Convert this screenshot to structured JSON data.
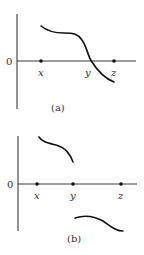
{
  "figures": [
    {
      "id": "a",
      "caption": "(a)",
      "origin_label": "0",
      "points": [
        {
          "label": "x",
          "px": 41
        },
        {
          "label": "y",
          "px": 92
        },
        {
          "label": "z",
          "px": 114
        }
      ],
      "description": "Continuous decreasing curve starting above x-axis at x, flattening, then dropping through zero at y and ending below axis at z"
    },
    {
      "id": "b",
      "caption": "(b)",
      "origin_label": "0",
      "points": [
        {
          "label": "x",
          "px": 37
        },
        {
          "label": "y",
          "px": 73
        },
        {
          "label": "z",
          "px": 121
        }
      ],
      "description": "Discontinuous function: positive decreasing piece from x to y, jump at y, negative decreasing piece from y to z"
    }
  ],
  "colors": {
    "curve": "#111111",
    "axis": "#3a3a3a",
    "text": "#333333",
    "background": "#ffffff"
  }
}
